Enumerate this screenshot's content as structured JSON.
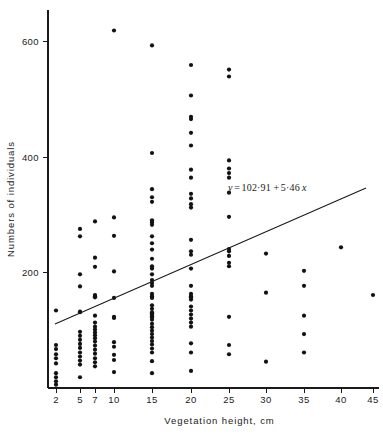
{
  "chart_data": {
    "type": "scatter",
    "title": "",
    "xlabel": "Vegetation height, cm",
    "ylabel": "Numbers of individuals",
    "grid": false,
    "legend": "none",
    "annotations": [
      {
        "name": "regression-equation",
        "text": "y = 102·91 + 5·46 x",
        "parts": {
          "lhs": "y",
          "eq": "=",
          "intercept": "102·91",
          "plus": "+",
          "slope": "5·46",
          "variable": "x"
        },
        "x_px": 228,
        "y_px": 191
      }
    ],
    "xticks": [
      2,
      5,
      7,
      10,
      15,
      20,
      25,
      30,
      35,
      40,
      45
    ],
    "xtick_labels": [
      "2",
      "5",
      "7",
      "10",
      "15",
      "20",
      "25",
      "30",
      "35",
      "40",
      "45"
    ],
    "xtick_px": [
      56,
      80,
      95,
      114,
      152,
      191,
      229,
      266,
      304,
      341,
      373
    ],
    "yticks": [
      200,
      400,
      600
    ],
    "ytick_labels": [
      "200",
      "400",
      "600"
    ],
    "ytick_px": [
      272,
      157,
      41
    ],
    "xlim": [
      2,
      45
    ],
    "ylim": [
      0,
      640
    ],
    "axis_geometry": {
      "x_axis_y_px": 388,
      "y_axis_x_px": 48,
      "y_axis_top_px": 10,
      "x_axis_right_px": 379
    },
    "fit": {
      "name": "least-squares-regression-line",
      "intercept": 102.91,
      "slope": 5.46,
      "x_start_px": 55,
      "y_start_px": 324,
      "x_end_px": 366,
      "y_end_px": 188
    },
    "series": [
      {
        "name": "individuals-per-vegetation-height",
        "marker": "filled-circle",
        "color": "#121212",
        "points": [
          [
            2,
            133
          ],
          [
            2,
            73
          ],
          [
            2,
            66
          ],
          [
            2,
            57
          ],
          [
            2,
            50
          ],
          [
            2,
            41
          ],
          [
            2,
            24
          ],
          [
            2,
            17
          ],
          [
            2,
            10
          ],
          [
            2,
            4
          ],
          [
            5,
            275
          ],
          [
            5,
            262
          ],
          [
            5,
            196
          ],
          [
            5,
            175
          ],
          [
            5,
            131
          ],
          [
            5,
            130
          ],
          [
            5,
            96
          ],
          [
            5,
            89
          ],
          [
            5,
            82
          ],
          [
            5,
            75
          ],
          [
            5,
            68
          ],
          [
            5,
            60
          ],
          [
            5,
            53
          ],
          [
            5,
            46
          ],
          [
            5,
            39
          ],
          [
            5,
            17
          ],
          [
            7,
            288
          ],
          [
            7,
            225
          ],
          [
            7,
            209
          ],
          [
            7,
            160
          ],
          [
            7,
            158
          ],
          [
            7,
            156
          ],
          [
            7,
            124
          ],
          [
            7,
            112
          ],
          [
            7,
            105
          ],
          [
            7,
            100
          ],
          [
            7,
            95
          ],
          [
            7,
            90
          ],
          [
            7,
            85
          ],
          [
            7,
            79
          ],
          [
            7,
            72
          ],
          [
            7,
            65
          ],
          [
            7,
            58
          ],
          [
            7,
            50
          ],
          [
            7,
            43
          ],
          [
            7,
            36
          ],
          [
            10,
            620
          ],
          [
            10,
            295
          ],
          [
            10,
            263
          ],
          [
            10,
            201
          ],
          [
            10,
            155
          ],
          [
            10,
            122
          ],
          [
            10,
            120
          ],
          [
            10,
            78
          ],
          [
            10,
            70
          ],
          [
            10,
            56
          ],
          [
            10,
            47
          ],
          [
            10,
            26
          ],
          [
            15,
            594
          ],
          [
            15,
            407
          ],
          [
            15,
            344
          ],
          [
            15,
            330
          ],
          [
            15,
            322
          ],
          [
            15,
            290
          ],
          [
            15,
            286
          ],
          [
            15,
            282
          ],
          [
            15,
            262
          ],
          [
            15,
            250
          ],
          [
            15,
            239
          ],
          [
            15,
            223
          ],
          [
            15,
            210
          ],
          [
            15,
            206
          ],
          [
            15,
            196
          ],
          [
            15,
            186
          ],
          [
            15,
            181
          ],
          [
            15,
            176
          ],
          [
            15,
            162
          ],
          [
            15,
            158
          ],
          [
            15,
            155
          ],
          [
            15,
            142
          ],
          [
            15,
            136
          ],
          [
            15,
            130
          ],
          [
            15,
            128
          ],
          [
            15,
            126
          ],
          [
            15,
            123
          ],
          [
            15,
            121
          ],
          [
            15,
            117
          ],
          [
            15,
            110
          ],
          [
            15,
            104
          ],
          [
            15,
            98
          ],
          [
            15,
            92
          ],
          [
            15,
            86
          ],
          [
            15,
            80
          ],
          [
            15,
            74
          ],
          [
            15,
            67
          ],
          [
            15,
            60
          ],
          [
            15,
            45
          ],
          [
            15,
            24
          ],
          [
            20,
            560
          ],
          [
            20,
            507
          ],
          [
            20,
            470
          ],
          [
            20,
            466
          ],
          [
            20,
            442
          ],
          [
            20,
            420
          ],
          [
            20,
            378
          ],
          [
            20,
            364
          ],
          [
            20,
            336
          ],
          [
            20,
            328
          ],
          [
            20,
            318
          ],
          [
            20,
            312
          ],
          [
            20,
            256
          ],
          [
            20,
            236
          ],
          [
            20,
            230
          ],
          [
            20,
            206
          ],
          [
            20,
            176
          ],
          [
            20,
            162
          ],
          [
            20,
            158
          ],
          [
            20,
            156
          ],
          [
            20,
            152
          ],
          [
            20,
            140
          ],
          [
            20,
            133
          ],
          [
            20,
            126
          ],
          [
            20,
            119
          ],
          [
            20,
            112
          ],
          [
            20,
            105
          ],
          [
            20,
            76
          ],
          [
            20,
            60
          ],
          [
            20,
            28
          ],
          [
            25,
            552
          ],
          [
            25,
            540
          ],
          [
            25,
            394
          ],
          [
            25,
            380
          ],
          [
            25,
            372
          ],
          [
            25,
            364
          ],
          [
            25,
            338
          ],
          [
            25,
            296
          ],
          [
            25,
            240
          ],
          [
            25,
            236
          ],
          [
            25,
            228
          ],
          [
            25,
            216
          ],
          [
            25,
            210
          ],
          [
            25,
            122
          ],
          [
            25,
            73
          ],
          [
            25,
            57
          ],
          [
            30,
            232
          ],
          [
            30,
            164
          ],
          [
            30,
            44
          ],
          [
            35,
            202
          ],
          [
            35,
            176
          ],
          [
            35,
            124
          ],
          [
            35,
            92
          ],
          [
            35,
            60
          ],
          [
            40,
            243
          ],
          [
            45,
            160
          ]
        ]
      }
    ]
  },
  "axis_labels": {
    "x_title": "Vegetation height, cm",
    "y_title": "Numbers  of  individuals"
  }
}
